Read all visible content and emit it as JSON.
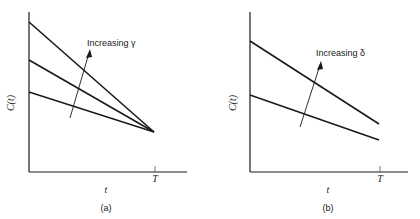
{
  "panels": [
    {
      "id": "a",
      "caption": "(a)",
      "ylabel": "C(t)",
      "xlabel": "t",
      "x_tick_label": "T",
      "annotation": "Increasing γ",
      "description": "Three straight lines decreasing from different intercepts, all converging to a common point at t = T"
    },
    {
      "id": "b",
      "caption": "(b)",
      "ylabel": "C(t)",
      "xlabel": "t",
      "x_tick_label": "T",
      "annotation": "Increasing δ",
      "description": "Two parallel-ish straight lines decreasing from different intercepts, ending at t = T at different values"
    }
  ],
  "colors": {
    "line": "#1a1a1a",
    "axis": "#1a1a1a",
    "background": "#ffffff"
  }
}
